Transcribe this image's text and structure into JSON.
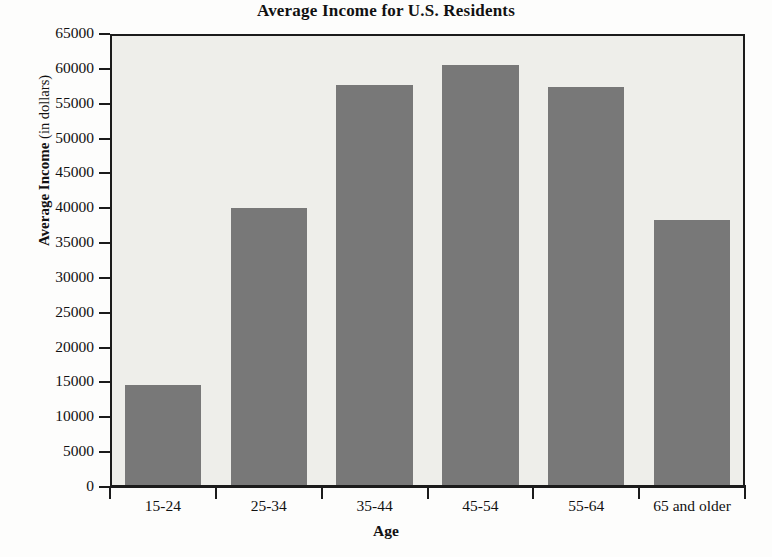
{
  "chart_data": {
    "type": "bar",
    "title": "Average Income for U.S. Residents",
    "xlabel": "Age",
    "ylabel": "Average Income (in dollars)",
    "ylabel_bold_part": "Average Income",
    "ylabel_light_part": "(in dollars)",
    "categories": [
      "15-24",
      "25-34",
      "35-44",
      "45-54",
      "55-64",
      "65 and older"
    ],
    "values": [
      14600,
      40100,
      57700,
      60600,
      57400,
      38300
    ],
    "ylim": [
      0,
      65000
    ],
    "ytick_step": 5000,
    "ytick_labels": [
      "65000",
      "60000",
      "55000",
      "50000",
      "45000",
      "40000",
      "35000",
      "30000",
      "25000",
      "20000",
      "15000",
      "10000",
      "5000",
      "0"
    ],
    "ytick_values": [
      65000,
      60000,
      55000,
      50000,
      45000,
      40000,
      35000,
      30000,
      25000,
      20000,
      15000,
      10000,
      5000,
      0
    ],
    "grid": false,
    "legend": false,
    "bar_color": "#787878",
    "plot_background": "#eeeeea",
    "axis_color": "#1b1b1b",
    "text_color": "#111111"
  }
}
